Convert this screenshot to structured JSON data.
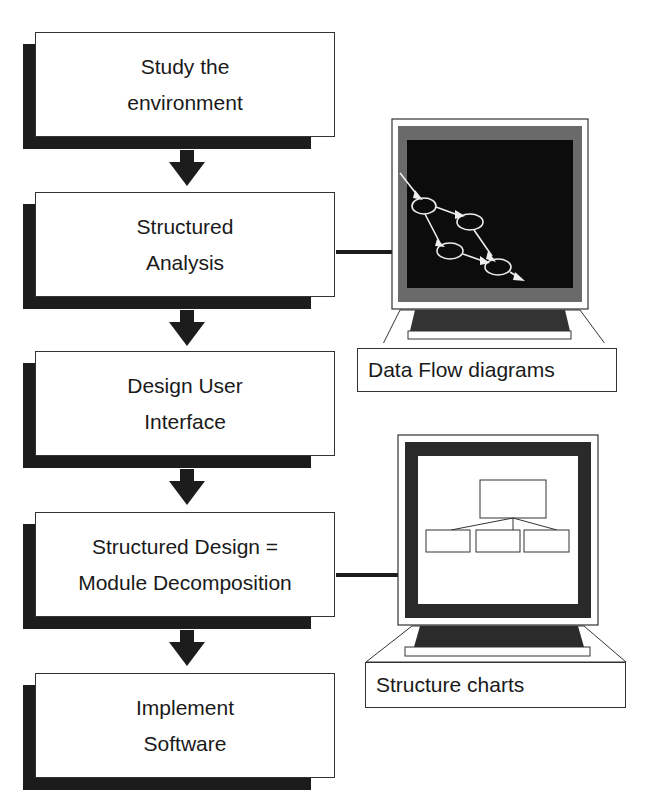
{
  "diagram": {
    "steps": [
      {
        "lines": [
          "Study the",
          "environment"
        ]
      },
      {
        "lines": [
          "Structured",
          "Analysis"
        ]
      },
      {
        "lines": [
          "Design User",
          "Interface"
        ]
      },
      {
        "lines": [
          "Structured Design  =",
          "Module Decomposition"
        ]
      },
      {
        "lines": [
          "Implement",
          "Software"
        ]
      }
    ],
    "side_panels": [
      {
        "caption": "Data Flow diagrams",
        "screen": "dark",
        "content": "data-flow-diagram",
        "attached_to_step": 2
      },
      {
        "caption": "Structure charts",
        "screen": "light",
        "content": "structure-chart",
        "attached_to_step": 4
      }
    ],
    "colors": {
      "ink": "#1c1c1c",
      "paper": "#ffffff"
    }
  }
}
